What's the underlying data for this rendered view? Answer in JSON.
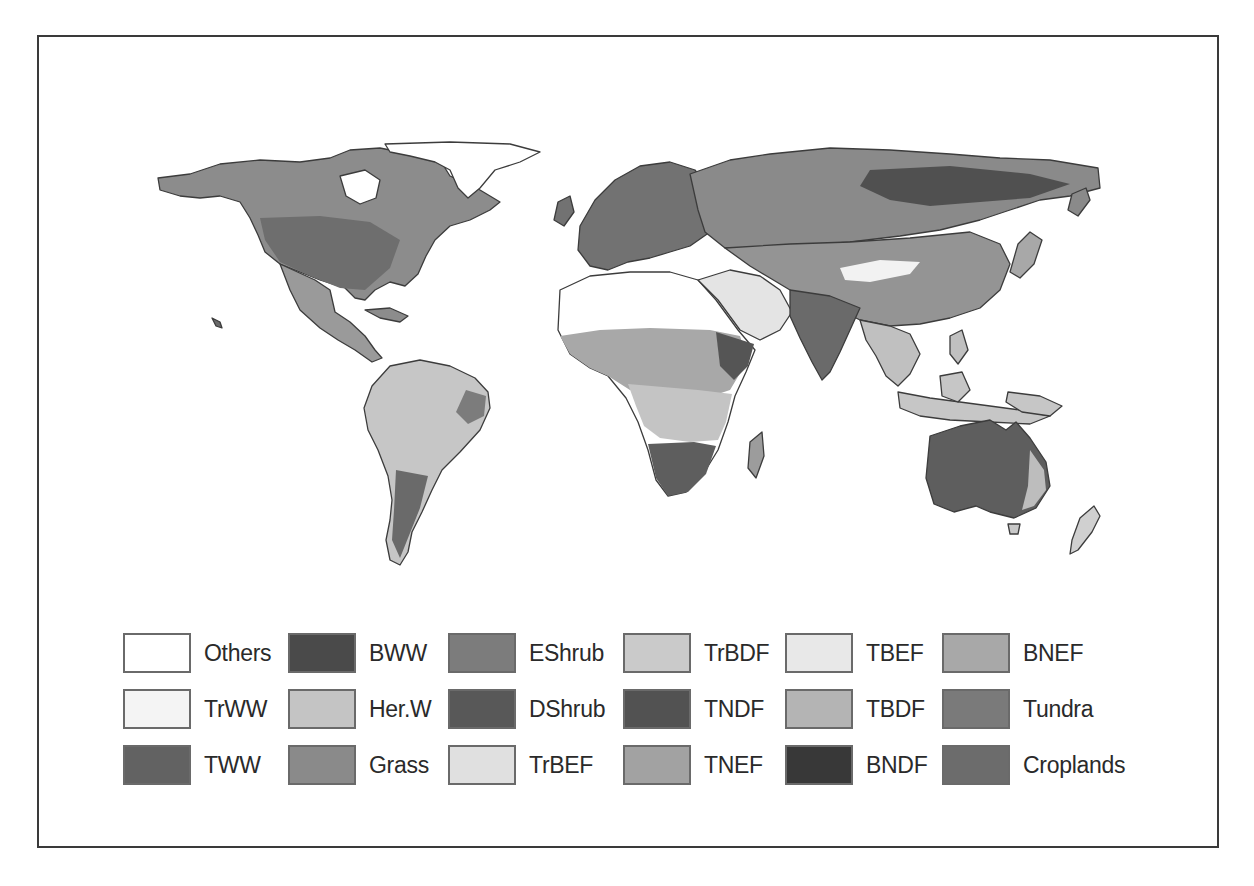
{
  "figure": {
    "type": "vegetation-type world map",
    "palette": "grayscale"
  },
  "map": {
    "regions": [
      {
        "name": "North America",
        "dominant_shade": "#7a7a7a"
      },
      {
        "name": "Greenland",
        "dominant_shade": "#ffffff"
      },
      {
        "name": "South America",
        "dominant_shade": "#c8c8c8"
      },
      {
        "name": "Europe",
        "dominant_shade": "#6e6e6e"
      },
      {
        "name": "Africa Sahara",
        "dominant_shade": "#ffffff"
      },
      {
        "name": "Africa Sub-Saharan",
        "dominant_shade": "#bdbdbd"
      },
      {
        "name": "Southern Africa",
        "dominant_shade": "#666666"
      },
      {
        "name": "Russia/Siberia",
        "dominant_shade": "#8a8a8a"
      },
      {
        "name": "Asia",
        "dominant_shade": "#8f8f8f"
      },
      {
        "name": "India",
        "dominant_shade": "#6a6a6a"
      },
      {
        "name": "Southeast Asia",
        "dominant_shade": "#c2c2c2"
      },
      {
        "name": "Australia",
        "dominant_shade": "#5f5f5f"
      },
      {
        "name": "New Zealand",
        "dominant_shade": "#d2d2d2"
      }
    ]
  },
  "legend": {
    "items": [
      {
        "label": "Others",
        "color": "#ffffff",
        "col": 0,
        "row": 0
      },
      {
        "label": "TrWW",
        "color": "#f4f4f4",
        "col": 0,
        "row": 1
      },
      {
        "label": "TWW",
        "color": "#626262",
        "col": 0,
        "row": 2
      },
      {
        "label": "BWW",
        "color": "#4a4a4a",
        "col": 1,
        "row": 0
      },
      {
        "label": "Her.W",
        "color": "#c4c4c4",
        "col": 1,
        "row": 1
      },
      {
        "label": "Grass",
        "color": "#8a8a8a",
        "col": 1,
        "row": 2
      },
      {
        "label": "EShrub",
        "color": "#7c7c7c",
        "col": 2,
        "row": 0
      },
      {
        "label": "DShrub",
        "color": "#585858",
        "col": 2,
        "row": 1
      },
      {
        "label": "TrBEF",
        "color": "#e0e0e0",
        "col": 2,
        "row": 2
      },
      {
        "label": "TrBDF",
        "color": "#cacaca",
        "col": 3,
        "row": 0
      },
      {
        "label": "TNDF",
        "color": "#525252",
        "col": 3,
        "row": 1
      },
      {
        "label": "TNEF",
        "color": "#a2a2a2",
        "col": 3,
        "row": 2
      },
      {
        "label": "TBEF",
        "color": "#e8e8e8",
        "col": 4,
        "row": 0
      },
      {
        "label": "TBDF",
        "color": "#b4b4b4",
        "col": 4,
        "row": 1
      },
      {
        "label": "BNDF",
        "color": "#383838",
        "col": 4,
        "row": 2
      },
      {
        "label": "BNEF",
        "color": "#a8a8a8",
        "col": 5,
        "row": 0
      },
      {
        "label": "Tundra",
        "color": "#7a7a7a",
        "col": 5,
        "row": 1
      },
      {
        "label": "Croplands",
        "color": "#6c6c6c",
        "col": 5,
        "row": 2
      }
    ]
  }
}
